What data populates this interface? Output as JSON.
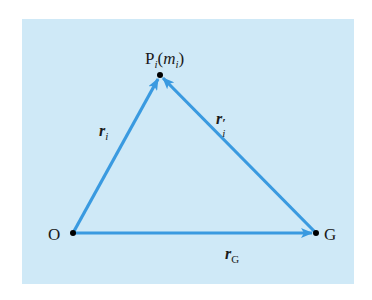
{
  "diagram": {
    "background_color": "#cfe9f7",
    "arrow_color": "#3a9ae0",
    "point_color": "#000000",
    "points": {
      "O": {
        "label": "O",
        "x": 73,
        "y": 233
      },
      "G": {
        "label": "G",
        "x": 316,
        "y": 233
      },
      "P": {
        "label_main": "P",
        "label_sub": "i",
        "label_paren_open": "(",
        "label_mass": "m",
        "label_mass_sub": "i",
        "label_paren_close": ")",
        "x": 160,
        "y": 75
      }
    },
    "vectors": [
      {
        "id": "r_i",
        "from": "O",
        "to": "P",
        "label_main": "r",
        "label_sub": "i"
      },
      {
        "id": "r_i_prime",
        "from": "G",
        "to": "P",
        "label_main": "r",
        "label_prime": "′",
        "label_sub": "i"
      },
      {
        "id": "r_G",
        "from": "O",
        "to": "G",
        "label_main": "r",
        "label_sub": "G"
      }
    ]
  }
}
